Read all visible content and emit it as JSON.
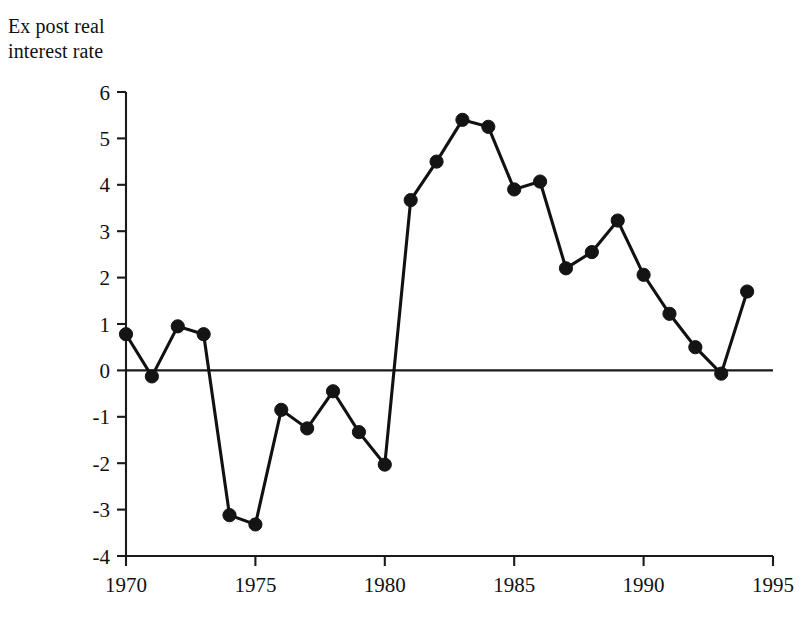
{
  "chart_data": {
    "type": "line",
    "title": "Ex post real\ninterest rate",
    "xlabel": "",
    "ylabel": "",
    "grid": false,
    "legend": false,
    "legend_position": "none",
    "xlim": [
      1970,
      1995
    ],
    "ylim": [
      -4,
      6
    ],
    "x_tick_labels": [
      "1970",
      "1975",
      "1980",
      "1985",
      "1990",
      "1995"
    ],
    "x_tick_values": [
      1970,
      1975,
      1980,
      1985,
      1990,
      1995
    ],
    "y_tick_labels": [
      "6",
      "5",
      "4",
      "3",
      "2",
      "1",
      "0",
      "-1",
      "-2",
      "-3",
      "-4"
    ],
    "y_tick_values": [
      6,
      5,
      4,
      3,
      2,
      1,
      0,
      -1,
      -2,
      -3,
      -4
    ],
    "x": [
      1970,
      1971,
      1972,
      1973,
      1974,
      1975,
      1976,
      1977,
      1978,
      1979,
      1980,
      1981,
      1982,
      1983,
      1984,
      1985,
      1986,
      1987,
      1988,
      1989,
      1990,
      1991,
      1992,
      1993,
      1994
    ],
    "values": [
      0.78,
      -0.13,
      0.95,
      0.78,
      -3.12,
      -3.32,
      -0.85,
      -1.25,
      -0.45,
      -1.33,
      -2.03,
      3.67,
      4.5,
      5.4,
      5.25,
      3.9,
      4.07,
      2.2,
      2.55,
      3.23,
      2.06,
      1.22,
      0.5,
      -0.07,
      1.7
    ],
    "series": [
      {
        "name": "Ex post real interest rate",
        "marker": "filled-circle",
        "color": "#141414",
        "values": [
          0.78,
          -0.13,
          0.95,
          0.78,
          -3.12,
          -3.32,
          -0.85,
          -1.25,
          -0.45,
          -1.33,
          -2.03,
          3.67,
          4.5,
          5.4,
          5.25,
          3.9,
          4.07,
          2.2,
          2.55,
          3.23,
          2.06,
          1.22,
          0.5,
          -0.07,
          1.7
        ]
      }
    ],
    "annotations": []
  },
  "colors": {
    "line": "#141414",
    "axis": "#1a1a1a",
    "background": "#ffffff",
    "text": "#111111"
  }
}
